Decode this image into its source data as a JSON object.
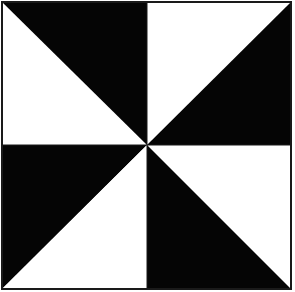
{
  "diagram": {
    "type": "pinwheel-quilt-block",
    "colors": {
      "dark": "#050505",
      "light": "#ffffff",
      "border": "#1a1a1a"
    },
    "bounds": {
      "x1": 2,
      "y1": 2,
      "x2": 291,
      "y2": 289
    },
    "center": {
      "x": 147,
      "y": 145
    },
    "quadrants": [
      {
        "name": "top-left",
        "dark_triangle": "upper-right",
        "light_triangle": "lower-left"
      },
      {
        "name": "top-right",
        "dark_triangle": "lower-right",
        "light_triangle": "upper-left"
      },
      {
        "name": "bottom-left",
        "dark_triangle": "upper-left",
        "light_triangle": "lower-right"
      },
      {
        "name": "bottom-right",
        "dark_triangle": "lower-left",
        "light_triangle": "upper-right"
      }
    ]
  }
}
